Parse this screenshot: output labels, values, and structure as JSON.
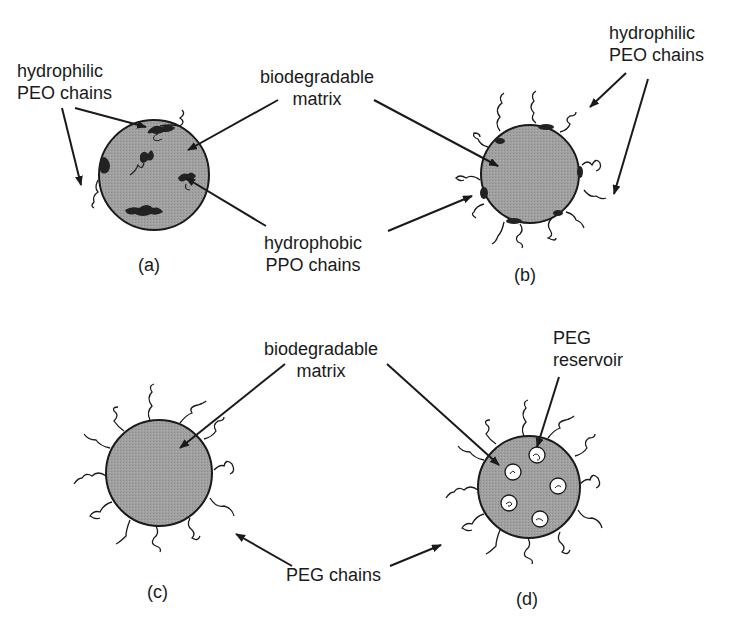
{
  "panels": {
    "a": {
      "caption": "(a)",
      "label_peo": [
        "hydrophilic",
        "PEO chains"
      ]
    },
    "b": {
      "caption": "(b)",
      "label_peo": [
        "hydrophilic",
        "PEO chains"
      ]
    },
    "c": {
      "caption": "(c)"
    },
    "d": {
      "caption": "(d)",
      "label_reservoir": [
        "PEG",
        "reservoir"
      ]
    }
  },
  "shared_labels": {
    "matrix_top": [
      "biodegradable",
      "matrix"
    ],
    "ppo": [
      "hydrophobic",
      "PPO chains"
    ],
    "matrix_bottom": [
      "biodegradable",
      "matrix"
    ],
    "peg_chains": "PEG chains"
  },
  "colors": {
    "particle_fill": "#9a9a9a",
    "stroke": "#1a1a1a",
    "background": "#ffffff"
  }
}
